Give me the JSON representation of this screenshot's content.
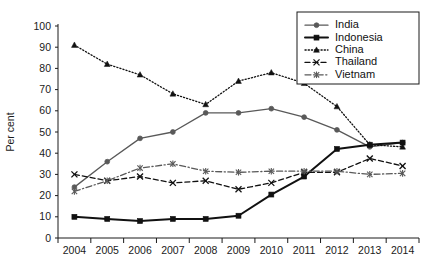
{
  "chart_data": {
    "type": "line",
    "title": "",
    "xlabel": "",
    "ylabel": "Per cent",
    "ylim": [
      0,
      100
    ],
    "ytick_step": 10,
    "yticks": [
      0,
      10,
      20,
      30,
      40,
      50,
      60,
      70,
      80,
      90,
      100
    ],
    "grid": false,
    "legend_position": "top-right",
    "categories": [
      "2004",
      "2005",
      "2006",
      "2007",
      "2008",
      "2009",
      "2010",
      "2011",
      "2012",
      "2013",
      "2014"
    ],
    "series": [
      {
        "name": "India",
        "color": "#595959",
        "marker": "circle",
        "dash": "none",
        "width": 1.3,
        "values": [
          24,
          36,
          47,
          50,
          59,
          59,
          61,
          57,
          51,
          43,
          45
        ]
      },
      {
        "name": "Indonesia",
        "color": "#111111",
        "marker": "square",
        "dash": "none",
        "width": 2.0,
        "values": [
          10,
          9,
          8,
          9,
          9,
          10.5,
          20.5,
          29,
          42,
          44,
          45
        ]
      },
      {
        "name": "China",
        "color": "#111111",
        "marker": "triangle",
        "dash": "dotted",
        "width": 1.3,
        "values": [
          91,
          82,
          77,
          68,
          63,
          74,
          78,
          73,
          62,
          44,
          43
        ]
      },
      {
        "name": "Thailand",
        "color": "#111111",
        "marker": "cross",
        "dash": "dashed",
        "width": 1.3,
        "values": [
          30,
          27,
          29,
          26,
          27,
          23,
          26,
          31,
          31,
          37.5,
          34
        ]
      },
      {
        "name": "Vietnam",
        "color": "#595959",
        "marker": "star",
        "dash": "dashdot",
        "width": 1.3,
        "values": [
          22,
          27,
          33,
          35,
          31.5,
          31,
          31.5,
          31.5,
          31.5,
          30,
          30.5
        ]
      }
    ]
  },
  "legend": {
    "entries": [
      {
        "label": "India"
      },
      {
        "label": "Indonesia"
      },
      {
        "label": "China"
      },
      {
        "label": "Thailand"
      },
      {
        "label": "Vietnam"
      }
    ]
  },
  "axes": {
    "y_title": "Per cent"
  }
}
